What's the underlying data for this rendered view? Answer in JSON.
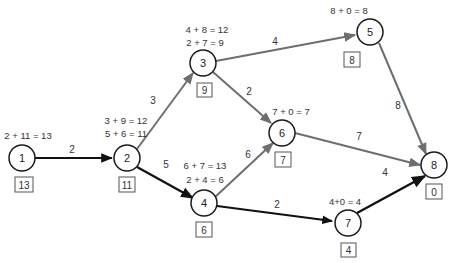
{
  "diagram": {
    "type": "critical-path-network",
    "colors": {
      "critical": "#111111",
      "noncritical": "#6e6e6e"
    },
    "nodes": [
      {
        "id": "1",
        "label": "1",
        "x": 22,
        "y": 158,
        "box": "13",
        "calc": [
          "2 + 11 = 13"
        ]
      },
      {
        "id": "2",
        "label": "2",
        "x": 127,
        "y": 158,
        "box": "11",
        "calc": [
          "3 + 9 = 12",
          "5 + 6 = 11"
        ]
      },
      {
        "id": "3",
        "label": "3",
        "x": 203,
        "y": 63,
        "box": "9",
        "calc": [
          "4 + 8 = 12",
          "2 + 7 = 9"
        ]
      },
      {
        "id": "4",
        "label": "4",
        "x": 204,
        "y": 207,
        "box": "6",
        "calc": [
          "6 + 7 = 13",
          "2 + 4 = 6"
        ]
      },
      {
        "id": "5",
        "label": "5",
        "x": 370,
        "y": 32,
        "box": "8",
        "calc": [
          "8 + 0 = 8"
        ]
      },
      {
        "id": "6",
        "label": "6",
        "x": 282,
        "y": 132,
        "box": "7",
        "calc": [
          "7 + 0 = 7"
        ]
      },
      {
        "id": "7",
        "label": "7",
        "x": 347,
        "y": 222,
        "box": "4",
        "calc": [
          "4+0 = 4"
        ]
      },
      {
        "id": "8",
        "label": "8",
        "x": 434,
        "y": 166,
        "box": "0",
        "calc": []
      }
    ],
    "edges": [
      {
        "from": "1",
        "to": "2",
        "weight": "2",
        "critical": true
      },
      {
        "from": "2",
        "to": "3",
        "weight": "3",
        "critical": false
      },
      {
        "from": "2",
        "to": "4",
        "weight": "5",
        "critical": true
      },
      {
        "from": "3",
        "to": "5",
        "weight": "4",
        "critical": false
      },
      {
        "from": "3",
        "to": "6",
        "weight": "2",
        "critical": false
      },
      {
        "from": "4",
        "to": "6",
        "weight": "6",
        "critical": false
      },
      {
        "from": "4",
        "to": "7",
        "weight": "2",
        "critical": true
      },
      {
        "from": "5",
        "to": "8",
        "weight": "8",
        "critical": false
      },
      {
        "from": "6",
        "to": "8",
        "weight": "7",
        "critical": false
      },
      {
        "from": "7",
        "to": "8",
        "weight": "4",
        "critical": true
      }
    ]
  }
}
